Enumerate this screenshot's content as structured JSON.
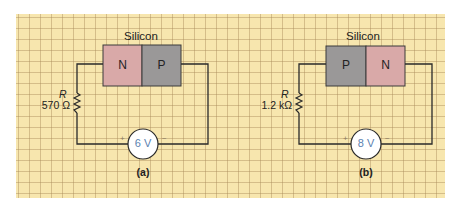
{
  "colors": {
    "grid_background": "#f7e6ae",
    "n_region": "#d9a9a8",
    "p_region": "#9a9898",
    "wire": "#2a2a2a",
    "voltage_text": "#5b7fb0"
  },
  "circuits": [
    {
      "id": "a",
      "caption": "(a)",
      "material_label": "Silicon",
      "junction": [
        {
          "type": "N",
          "label": "N"
        },
        {
          "type": "P",
          "label": "P"
        }
      ],
      "resistor": {
        "symbol": "R",
        "value": "570 Ω"
      },
      "source": {
        "value": "6 V",
        "plus": "+",
        "minus": "−"
      }
    },
    {
      "id": "b",
      "caption": "(b)",
      "material_label": "Silicon",
      "junction": [
        {
          "type": "P",
          "label": "P"
        },
        {
          "type": "N",
          "label": "N"
        }
      ],
      "resistor": {
        "symbol": "R",
        "value": "1.2 kΩ"
      },
      "source": {
        "value": "8 V",
        "plus": "+",
        "minus": "−"
      }
    }
  ]
}
